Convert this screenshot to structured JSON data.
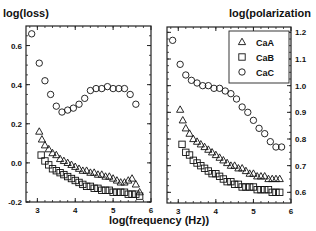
{
  "chart_data": [
    {
      "type": "scatter",
      "title": "",
      "ylabel": "log(loss)",
      "xlabel": "log(frequency (Hz))",
      "xlim": [
        2.7,
        6.0
      ],
      "ylim": [
        -0.2,
        0.7
      ],
      "x_ticks": [
        3,
        4,
        5,
        6
      ],
      "y_ticks": [
        -0.2,
        0.0,
        0.2,
        0.4,
        0.6
      ],
      "y_tick_labels": [
        "-0.2",
        "0.0",
        "0.2",
        "0.4",
        "0.6"
      ],
      "y_axis_side": "left",
      "grid": false,
      "series": [
        {
          "name": "CaA",
          "marker": "triangle",
          "x": [
            3.05,
            3.12,
            3.2,
            3.3,
            3.4,
            3.5,
            3.6,
            3.7,
            3.8,
            3.9,
            4.0,
            4.1,
            4.2,
            4.3,
            4.4,
            4.5,
            4.6,
            4.7,
            4.8,
            4.9,
            5.0,
            5.1,
            5.2,
            5.3,
            5.4,
            5.5,
            5.6,
            5.7
          ],
          "y": [
            0.16,
            0.12,
            0.09,
            0.07,
            0.05,
            0.04,
            0.02,
            0.01,
            0.0,
            -0.01,
            -0.02,
            -0.03,
            -0.04,
            -0.04,
            -0.05,
            -0.05,
            -0.06,
            -0.06,
            -0.07,
            -0.07,
            -0.08,
            -0.09,
            -0.1,
            -0.1,
            -0.09,
            -0.08,
            -0.11,
            -0.15
          ]
        },
        {
          "name": "CaB",
          "marker": "square",
          "x": [
            3.1,
            3.2,
            3.3,
            3.4,
            3.5,
            3.6,
            3.7,
            3.8,
            3.9,
            4.0,
            4.1,
            4.2,
            4.3,
            4.4,
            4.5,
            4.6,
            4.7,
            4.8,
            4.9,
            5.0,
            5.1,
            5.2,
            5.3,
            5.4,
            5.5,
            5.6,
            5.7
          ],
          "y": [
            0.04,
            0.01,
            -0.01,
            -0.03,
            -0.04,
            -0.05,
            -0.06,
            -0.07,
            -0.08,
            -0.09,
            -0.1,
            -0.11,
            -0.12,
            -0.12,
            -0.13,
            -0.13,
            -0.14,
            -0.14,
            -0.14,
            -0.15,
            -0.15,
            -0.15,
            -0.15,
            -0.16,
            -0.16,
            -0.16,
            -0.17
          ]
        },
        {
          "name": "CaC",
          "marker": "circle",
          "x": [
            2.85,
            3.05,
            3.2,
            3.35,
            3.5,
            3.65,
            3.8,
            3.95,
            4.1,
            4.25,
            4.4,
            4.55,
            4.7,
            4.85,
            5.0,
            5.15,
            5.3,
            5.45,
            5.6
          ],
          "y": [
            0.66,
            0.51,
            0.42,
            0.35,
            0.29,
            0.26,
            0.27,
            0.28,
            0.3,
            0.33,
            0.37,
            0.38,
            0.38,
            0.39,
            0.38,
            0.38,
            0.38,
            0.35,
            0.3
          ]
        }
      ]
    },
    {
      "type": "scatter",
      "title": "",
      "ylabel": "log(polarization",
      "xlabel": "log(frequency (Hz))",
      "xlim": [
        2.7,
        6.0
      ],
      "ylim": [
        0.56,
        1.22
      ],
      "x_ticks": [
        3,
        4,
        5,
        6
      ],
      "y_ticks": [
        0.6,
        0.7,
        0.8,
        0.9,
        1.0,
        1.1,
        1.2
      ],
      "y_tick_labels": [
        "0.6",
        "0.7",
        "0.8",
        "0.9",
        "1.0",
        "1.1",
        "1.2"
      ],
      "y_axis_side": "right",
      "grid": false,
      "legend": {
        "position": "upper right",
        "entries": [
          "CaA",
          "CaB",
          "CaC"
        ]
      },
      "series": [
        {
          "name": "CaA",
          "marker": "triangle",
          "x": [
            3.05,
            3.12,
            3.2,
            3.3,
            3.4,
            3.5,
            3.6,
            3.7,
            3.8,
            3.9,
            4.0,
            4.1,
            4.2,
            4.3,
            4.4,
            4.5,
            4.6,
            4.7,
            4.8,
            4.9,
            5.0,
            5.1,
            5.2,
            5.3,
            5.4,
            5.5,
            5.6,
            5.7
          ],
          "y": [
            0.91,
            0.87,
            0.84,
            0.82,
            0.8,
            0.79,
            0.78,
            0.77,
            0.76,
            0.75,
            0.74,
            0.73,
            0.72,
            0.71,
            0.7,
            0.7,
            0.69,
            0.69,
            0.68,
            0.67,
            0.67,
            0.66,
            0.66,
            0.66,
            0.65,
            0.65,
            0.65,
            0.65
          ]
        },
        {
          "name": "CaB",
          "marker": "square",
          "x": [
            3.1,
            3.2,
            3.3,
            3.4,
            3.5,
            3.6,
            3.7,
            3.8,
            3.9,
            4.0,
            4.1,
            4.2,
            4.3,
            4.4,
            4.5,
            4.6,
            4.7,
            4.8,
            4.9,
            5.0,
            5.1,
            5.2,
            5.3,
            5.4,
            5.5,
            5.6,
            5.7
          ],
          "y": [
            0.78,
            0.75,
            0.74,
            0.72,
            0.71,
            0.7,
            0.69,
            0.68,
            0.67,
            0.67,
            0.66,
            0.65,
            0.64,
            0.64,
            0.63,
            0.63,
            0.62,
            0.62,
            0.62,
            0.62,
            0.61,
            0.61,
            0.61,
            0.61,
            0.6,
            0.6,
            0.6
          ]
        },
        {
          "name": "CaC",
          "marker": "circle",
          "x": [
            2.85,
            3.05,
            3.2,
            3.35,
            3.5,
            3.65,
            3.8,
            3.95,
            4.1,
            4.25,
            4.4,
            4.55,
            4.7,
            4.85,
            5.0,
            5.15,
            5.3,
            5.45,
            5.6,
            5.75
          ],
          "y": [
            1.17,
            1.08,
            1.04,
            1.02,
            1.01,
            1.0,
            1.0,
            0.99,
            0.99,
            0.98,
            0.97,
            0.95,
            0.92,
            0.9,
            0.87,
            0.84,
            0.82,
            0.79,
            0.77,
            0.77
          ]
        }
      ]
    }
  ]
}
